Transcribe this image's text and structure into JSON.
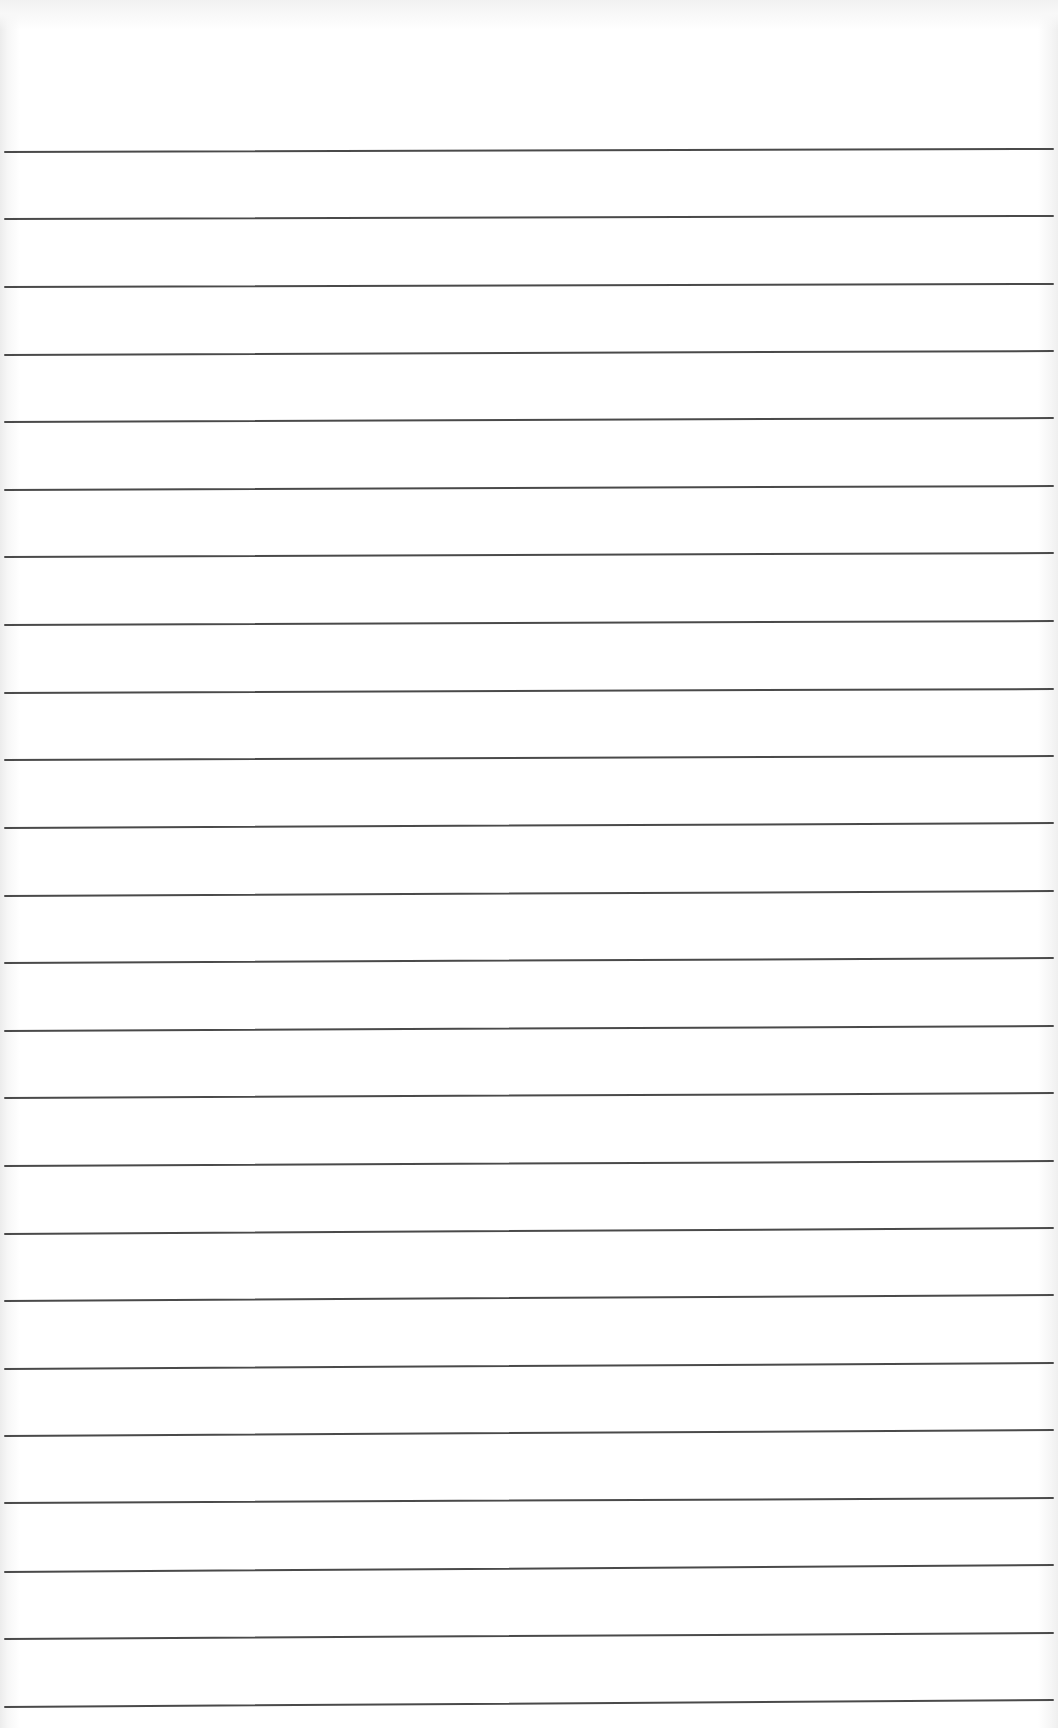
{
  "document": {
    "type": "lined-paper",
    "line_color": "#4a4a4a",
    "line_count": 24,
    "line_spacing_px": 67.6,
    "first_line_y": 152,
    "line_left_x": 5,
    "line_right_x": 1053,
    "lines": [
      {
        "y_left": 152,
        "y_right": 149
      },
      {
        "y_left": 219,
        "y_right": 216
      },
      {
        "y_left": 287,
        "y_right": 284
      },
      {
        "y_left": 355,
        "y_right": 351
      },
      {
        "y_left": 422,
        "y_right": 418
      },
      {
        "y_left": 490,
        "y_right": 486
      },
      {
        "y_left": 557,
        "y_right": 553
      },
      {
        "y_left": 625,
        "y_right": 621
      },
      {
        "y_left": 693,
        "y_right": 689
      },
      {
        "y_left": 760,
        "y_right": 756
      },
      {
        "y_left": 828,
        "y_right": 823
      },
      {
        "y_left": 896,
        "y_right": 891
      },
      {
        "y_left": 963,
        "y_right": 958
      },
      {
        "y_left": 1031,
        "y_right": 1026
      },
      {
        "y_left": 1098,
        "y_right": 1093
      },
      {
        "y_left": 1166,
        "y_right": 1161
      },
      {
        "y_left": 1234,
        "y_right": 1228
      },
      {
        "y_left": 1301,
        "y_right": 1295
      },
      {
        "y_left": 1369,
        "y_right": 1363
      },
      {
        "y_left": 1436,
        "y_right": 1430
      },
      {
        "y_left": 1503,
        "y_right": 1498
      },
      {
        "y_left": 1572,
        "y_right": 1565
      },
      {
        "y_left": 1639,
        "y_right": 1633
      },
      {
        "y_left": 1707,
        "y_right": 1700
      }
    ]
  }
}
